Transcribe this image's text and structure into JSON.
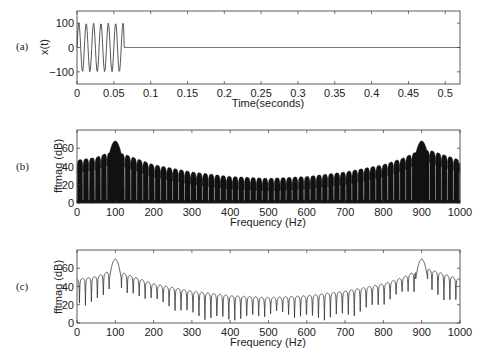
{
  "chart_data": [
    {
      "panel": "(a)",
      "type": "line",
      "title": "",
      "xlabel": "Time(seconds)",
      "ylabel": "x(t)",
      "xlim": [
        0,
        0.52
      ],
      "ylim": [
        -150,
        150
      ],
      "xticks": [
        "0",
        "0.05",
        "0.1",
        "0.15",
        "0.2",
        "0.25",
        "0.3",
        "0.35",
        "0.4",
        "0.45",
        "0.5"
      ],
      "yticks": [
        "-100",
        "0",
        "100"
      ],
      "description": "100 Hz sinusoid, amplitude 100, lasting ~0.064 s (about 6.5 cycles), then zero to 0.52 s",
      "signal": {
        "frequency_hz": 100,
        "amplitude": 100,
        "duration_s": 0.064,
        "total_s": 0.52
      },
      "grid": false
    },
    {
      "panel": "(b)",
      "type": "line",
      "title": "",
      "xlabel": "Frequency (Hz)",
      "ylabel": "fftmag (dB)",
      "xlim": [
        0,
        1000
      ],
      "ylim": [
        0,
        80
      ],
      "xticks": [
        "0",
        "100",
        "200",
        "300",
        "400",
        "500",
        "600",
        "700",
        "800",
        "900",
        "1000"
      ],
      "yticks": [
        "0",
        "20",
        "40",
        "60"
      ],
      "description": "Dense FFT magnitude spectrum (filled), main lobes at 100 Hz and 900 Hz (~68 dB), sidelobe envelope decaying to ~27 dB near 500 Hz",
      "peaks": [
        {
          "x": 100,
          "y": 68
        },
        {
          "x": 900,
          "y": 68
        }
      ],
      "sidelobe_envelope": {
        "x": [
          0,
          50,
          80,
          120,
          200,
          300,
          400,
          500,
          600,
          700,
          800,
          850,
          880,
          920,
          1000
        ],
        "y": [
          47,
          50,
          55,
          54,
          42,
          34,
          29,
          27,
          29,
          34,
          42,
          49,
          55,
          58,
          47
        ]
      },
      "grid": false
    },
    {
      "panel": "(c)",
      "type": "line",
      "title": "",
      "xlabel": "Frequency (Hz)",
      "ylabel": "fftmag (dB)",
      "xlim": [
        0,
        1000
      ],
      "ylim": [
        0,
        80
      ],
      "xticks": [
        "0",
        "100",
        "200",
        "300",
        "400",
        "500",
        "600",
        "700",
        "800",
        "900",
        "1000"
      ],
      "yticks": [
        "0",
        "20",
        "40",
        "60"
      ],
      "description": "Lower-resolution FFT magnitude spectrum (line), main lobes at 100 Hz and 900 Hz (~70 dB), sidelobes spaced ~16 Hz with nulls dipping to 5-25 dB",
      "peaks": [
        {
          "x": 100,
          "y": 70
        },
        {
          "x": 900,
          "y": 70
        }
      ],
      "sidelobe_spacing_hz": 15.6,
      "grid": false
    }
  ],
  "labels": {
    "panel_a": "(a)",
    "panel_b": "(b)",
    "panel_c": "(c)",
    "a_ylabel": "x(t)",
    "a_xlabel": "Time(seconds)",
    "b_ylabel": "fftmag (dB)",
    "b_xlabel": "Frequency (Hz)",
    "c_ylabel": "fftmag (dB)",
    "c_xlabel": "Frequency (Hz)"
  }
}
